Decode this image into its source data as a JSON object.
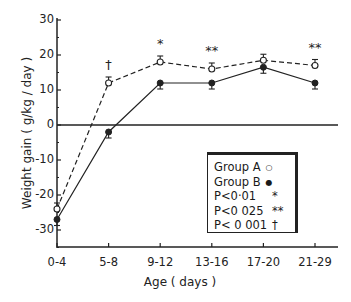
{
  "chart_data": {
    "type": "line",
    "title": "",
    "xlabel": "Age  ( days )",
    "ylabel": "Weight gain  ( g/kg / day )",
    "categories": [
      "0-4",
      "5-8",
      "9-12",
      "13-16",
      "17-20",
      "21-29"
    ],
    "series": [
      {
        "name": "Group A",
        "marker": "open-circle",
        "line": "dashed",
        "values": [
          -24,
          12,
          18,
          16,
          18.5,
          17
        ]
      },
      {
        "name": "Group B",
        "marker": "filled-circle",
        "line": "solid",
        "values": [
          -27,
          -2,
          12,
          12,
          16.5,
          12
        ]
      }
    ],
    "significance": [
      "",
      "†",
      "*",
      "**",
      "",
      "**"
    ],
    "ylim": [
      -36,
      30
    ],
    "yticks": [
      30,
      20,
      10,
      0,
      -10,
      -20,
      -30
    ],
    "grid": false,
    "zero_line": true,
    "legend_position": "lower right"
  },
  "legend": {
    "items": [
      {
        "label": "Group A",
        "symbol": "○"
      },
      {
        "label": "Group B",
        "symbol": "●"
      },
      {
        "label": "P<0·01",
        "symbol": "*"
      },
      {
        "label": "P<0 025",
        "symbol": "**"
      },
      {
        "label": "P< 0 001",
        "symbol": "†"
      }
    ]
  },
  "axes": {
    "ytick_labels": [
      "30",
      "20",
      "10",
      "0",
      "-10",
      "-20",
      "-30"
    ],
    "xtick_labels": [
      "0-4",
      "5-8",
      "9-12",
      "13-16",
      "17-20",
      "21-29"
    ]
  },
  "colors": {
    "ink": "#1a1a1a",
    "background": "#ffffff"
  }
}
